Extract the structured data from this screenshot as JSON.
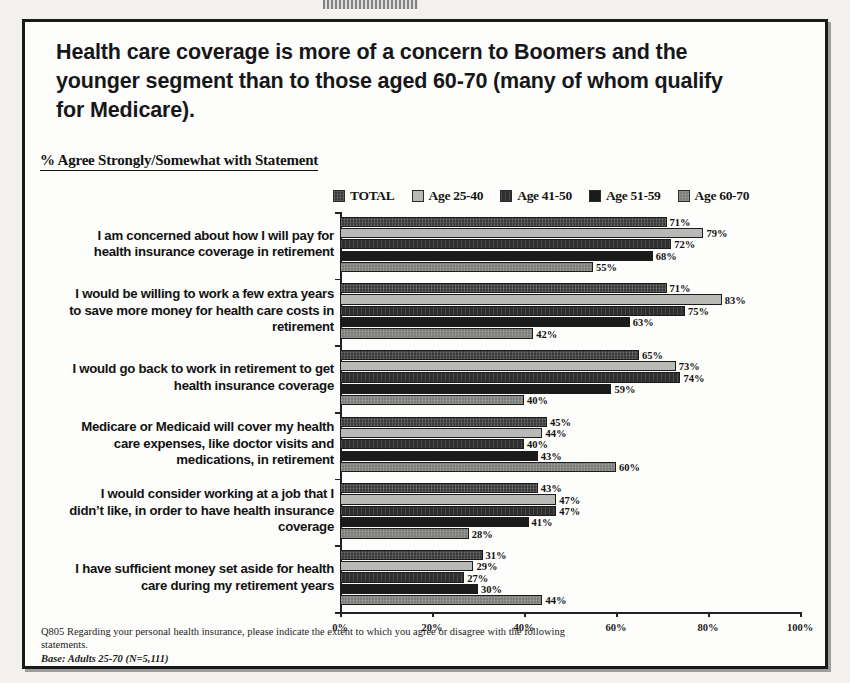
{
  "slide": {
    "headline": "Health care coverage is more of a concern to Boomers and the younger segment than to those aged 60-70 (many of whom qualify for Medicare).",
    "subtitle": "% Agree Strongly/Somewhat with Statement",
    "footnote_question": "Q805 Regarding your personal health insurance, please indicate the extent to which you agree or disagree with the following statements.",
    "footnote_base": "Base: Adults 25-70 (N=5,111)"
  },
  "colors": {
    "series_total": "#3a3a3a",
    "series_25_40": "#b9b9b7",
    "series_41_50": "#2e2e2e",
    "series_51_59": "#1b1b1b",
    "series_60_70": "#7d7d7b",
    "axis": "#222222",
    "frame": "#1a1a1a",
    "text": "#121212"
  },
  "chart_data": {
    "type": "bar",
    "orientation": "horizontal",
    "title": "% Agree Strongly/Somewhat with Statement",
    "xlabel": "",
    "ylabel": "",
    "xlim": [
      0,
      100
    ],
    "xticks": [
      "0%",
      "20%",
      "40%",
      "60%",
      "80%",
      "100%"
    ],
    "xtick_values": [
      0,
      20,
      40,
      60,
      80,
      100
    ],
    "grid": false,
    "legend_position": "top-right",
    "value_suffix": "%",
    "categories": [
      "I am concerned about how I will pay for health insurance coverage in retirement",
      "I would be willing to work a few extra years to save more money for health care costs in retirement",
      "I would go back to work in retirement to get health insurance coverage",
      "Medicare or Medicaid will cover my health care expenses, like doctor visits and medications, in retirement",
      "I would consider working at a job that I didn’t like, in order to have health insurance coverage",
      "I have sufficient money set aside for health care during my retirement years"
    ],
    "series": [
      {
        "name": "TOTAL",
        "color": "#3a3a3a",
        "values": [
          71,
          71,
          65,
          45,
          43,
          31
        ]
      },
      {
        "name": "Age 25-40",
        "color": "#b9b9b7",
        "values": [
          79,
          83,
          73,
          44,
          47,
          29
        ]
      },
      {
        "name": "Age 41-50",
        "color": "#2e2e2e",
        "values": [
          72,
          75,
          74,
          40,
          47,
          27
        ]
      },
      {
        "name": "Age 51-59",
        "color": "#1b1b1b",
        "values": [
          68,
          63,
          59,
          43,
          41,
          30
        ]
      },
      {
        "name": "Age 60-70",
        "color": "#7d7d7b",
        "values": [
          55,
          42,
          40,
          60,
          28,
          44
        ]
      }
    ]
  }
}
